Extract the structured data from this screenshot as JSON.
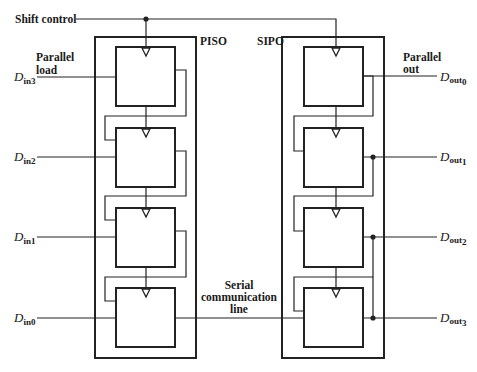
{
  "diagram": {
    "shift_control": "Shift control",
    "piso": {
      "label": "PISO",
      "parallel_load_line1": "Parallel",
      "parallel_load_line2": "load",
      "inputs": [
        {
          "base": "D",
          "sub": "in3"
        },
        {
          "base": "D",
          "sub": "in2"
        },
        {
          "base": "D",
          "sub": "in1"
        },
        {
          "base": "D",
          "sub": "in0"
        }
      ]
    },
    "sipo": {
      "label": "SIPO",
      "parallel_out_line1": "Parallel",
      "parallel_out_line2": "out",
      "outputs": [
        {
          "base": "D",
          "sub": "out",
          "idx": "0"
        },
        {
          "base": "D",
          "sub": "out",
          "idx": "1"
        },
        {
          "base": "D",
          "sub": "out",
          "idx": "2"
        },
        {
          "base": "D",
          "sub": "out",
          "idx": "3"
        }
      ]
    },
    "serial_line": {
      "line1": "Serial",
      "line2": "communication",
      "line3": "line"
    }
  }
}
